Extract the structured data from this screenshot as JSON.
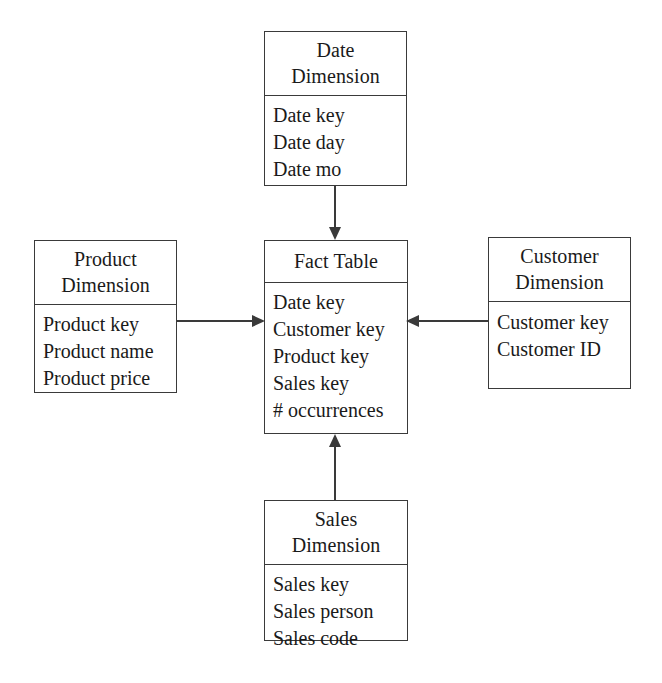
{
  "diagram": {
    "type": "star-schema",
    "entities": [
      {
        "id": "date",
        "title_lines": [
          "Date",
          "Dimension"
        ],
        "fields": [
          "Date key",
          "Date day",
          "Date mo"
        ]
      },
      {
        "id": "product",
        "title_lines": [
          "Product",
          "Dimension"
        ],
        "fields": [
          "Product key",
          "Product name",
          "Product price"
        ]
      },
      {
        "id": "fact",
        "title_lines": [
          "Fact Table"
        ],
        "fields": [
          "Date key",
          "Customer key",
          "Product key",
          "Sales key",
          "# occurrences"
        ]
      },
      {
        "id": "customer",
        "title_lines": [
          "Customer",
          "Dimension"
        ],
        "fields": [
          "Customer key",
          "Customer ID"
        ]
      },
      {
        "id": "sales",
        "title_lines": [
          "Sales",
          "Dimension"
        ],
        "fields": [
          "Sales key",
          "Sales person",
          "Sales code"
        ]
      }
    ],
    "connectors": [
      {
        "id": "date-fact",
        "from": "date",
        "to": "fact",
        "direction": "down"
      },
      {
        "id": "product-fact",
        "from": "product",
        "to": "fact",
        "direction": "right"
      },
      {
        "id": "customer-fact",
        "from": "customer",
        "to": "fact",
        "direction": "left"
      },
      {
        "id": "sales-fact",
        "from": "sales",
        "to": "fact",
        "direction": "up"
      }
    ],
    "colors": {
      "stroke": "#3a3a3a",
      "background": "#ffffff",
      "text": "#1a1a1a"
    }
  }
}
